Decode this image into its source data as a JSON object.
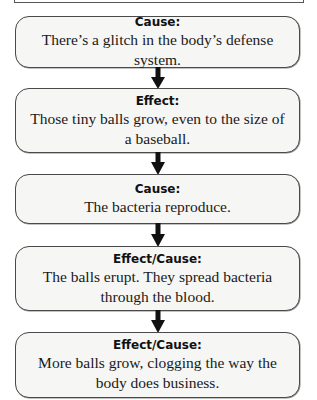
{
  "diagram": {
    "type": "cause-effect flowchart",
    "arrow_color": "#111111",
    "box_fill": "#f6f6f5",
    "box_border": "#4a4a4a",
    "steps": [
      {
        "label": "Cause:",
        "text": "There’s a glitch in the body’s defense system."
      },
      {
        "label": "Effect:",
        "text": "Those tiny balls grow, even to the size of a baseball."
      },
      {
        "label": "Cause:",
        "text": "The bacteria reproduce."
      },
      {
        "label": "Effect/Cause:",
        "text": "The balls erupt. They spread bacteria through the blood."
      },
      {
        "label": "Effect/Cause:",
        "text": "More balls grow, clogging the way the body does business."
      }
    ]
  }
}
